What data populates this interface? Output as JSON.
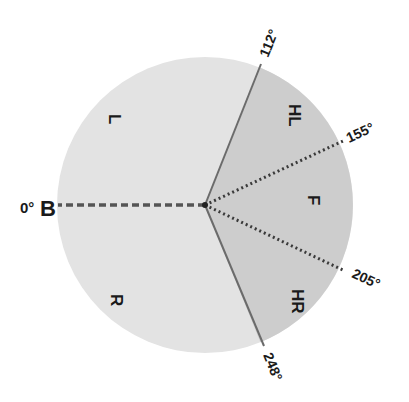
{
  "diagram": {
    "center": [
      205,
      205
    ],
    "radius": 148,
    "colors": {
      "light_region": "#e3e3e3",
      "dark_region": "#cdcdcd",
      "solid_line": "#6b6b6b",
      "dotted_line": "#3a3a3a",
      "dashed_line": "#555555",
      "text": "#1a1a1a"
    },
    "boundaries": [
      {
        "label": "0°B",
        "angle_label": "0°",
        "marker": "B",
        "bearing": 0,
        "style": "dashed"
      },
      {
        "label": "112°",
        "bearing": 112,
        "style": "solid"
      },
      {
        "label": "155°",
        "bearing": 155,
        "style": "dotted"
      },
      {
        "label": "205°",
        "bearing": 205,
        "style": "dotted"
      },
      {
        "label": "248°",
        "bearing": 248,
        "style": "solid"
      }
    ],
    "regions": [
      {
        "label": "L",
        "from": 0,
        "to": 112
      },
      {
        "label": "HL",
        "from": 112,
        "to": 155
      },
      {
        "label": "F",
        "from": 155,
        "to": 205
      },
      {
        "label": "HR",
        "from": 205,
        "to": 248
      },
      {
        "label": "R",
        "from": 248,
        "to": 360
      }
    ]
  }
}
